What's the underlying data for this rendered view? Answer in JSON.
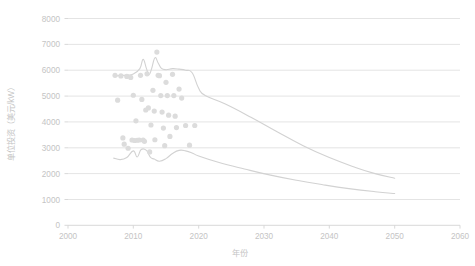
{
  "chart_data": {
    "type": "scatter",
    "title": "",
    "xlabel": "年份",
    "ylabel": "单位投资（美元/kW）",
    "xlim": [
      2000,
      2060
    ],
    "ylim": [
      0,
      8000
    ],
    "xticks": [
      "2000",
      "2010",
      "2020",
      "2030",
      "2040",
      "2050",
      "2060"
    ],
    "yticks": [
      "0",
      "1000",
      "2000",
      "3000",
      "4000",
      "5000",
      "6000",
      "7000",
      "8000"
    ],
    "grid": "horizontal",
    "legend": "none",
    "series": [
      {
        "name": "upper-trend-line",
        "type": "line",
        "color": "#d2d2d2",
        "points": [
          [
            2007,
            5780
          ],
          [
            2008,
            5790
          ],
          [
            2009,
            5810
          ],
          [
            2010,
            5850
          ],
          [
            2011,
            6060
          ],
          [
            2011.5,
            6420
          ],
          [
            2012,
            6070
          ],
          [
            2012.4,
            5830
          ],
          [
            2012.8,
            6060
          ],
          [
            2013.3,
            6480
          ],
          [
            2013.8,
            6280
          ],
          [
            2014.3,
            6070
          ],
          [
            2015,
            6020
          ],
          [
            2016,
            6060
          ],
          [
            2017,
            6040
          ],
          [
            2018,
            6000
          ],
          [
            2019,
            5900
          ],
          [
            2020,
            5300
          ],
          [
            2021,
            5020
          ],
          [
            2024,
            4700
          ],
          [
            2028,
            4180
          ],
          [
            2032,
            3620
          ],
          [
            2036,
            3080
          ],
          [
            2040,
            2620
          ],
          [
            2044,
            2240
          ],
          [
            2047,
            2000
          ],
          [
            2050,
            1820
          ]
        ]
      },
      {
        "name": "lower-trend-line",
        "type": "line",
        "color": "#d2d2d2",
        "points": [
          [
            2007,
            2600
          ],
          [
            2008,
            2540
          ],
          [
            2009,
            2620
          ],
          [
            2010,
            2880
          ],
          [
            2010.6,
            2640
          ],
          [
            2011.2,
            2930
          ],
          [
            2012,
            2900
          ],
          [
            2012.6,
            2640
          ],
          [
            2013.2,
            2560
          ],
          [
            2014,
            2480
          ],
          [
            2015,
            2580
          ],
          [
            2016,
            2780
          ],
          [
            2017,
            2900
          ],
          [
            2018,
            2880
          ],
          [
            2019,
            2800
          ],
          [
            2020,
            2680
          ],
          [
            2023,
            2440
          ],
          [
            2027,
            2180
          ],
          [
            2031,
            1940
          ],
          [
            2035,
            1740
          ],
          [
            2039,
            1570
          ],
          [
            2043,
            1420
          ],
          [
            2047,
            1300
          ],
          [
            2050,
            1230
          ]
        ]
      },
      {
        "name": "scatter-points",
        "type": "scatter",
        "color": "#dcdcdc",
        "points": [
          [
            2007.2,
            5800
          ],
          [
            2007.6,
            4840
          ],
          [
            2008.1,
            5780
          ],
          [
            2008.4,
            3380
          ],
          [
            2008.6,
            3140
          ],
          [
            2009.0,
            5760
          ],
          [
            2009.2,
            2980
          ],
          [
            2009.6,
            5720
          ],
          [
            2009.8,
            3300
          ],
          [
            2010.0,
            5030
          ],
          [
            2010.2,
            3280
          ],
          [
            2010.4,
            4040
          ],
          [
            2010.6,
            3290
          ],
          [
            2010.9,
            3300
          ],
          [
            2011.1,
            5800
          ],
          [
            2011.3,
            4870
          ],
          [
            2011.5,
            3300
          ],
          [
            2011.7,
            3250
          ],
          [
            2011.9,
            4460
          ],
          [
            2012.1,
            5860
          ],
          [
            2012.3,
            4540
          ],
          [
            2012.5,
            2840
          ],
          [
            2012.7,
            3880
          ],
          [
            2013.0,
            5220
          ],
          [
            2013.2,
            4420
          ],
          [
            2013.3,
            3310
          ],
          [
            2013.6,
            6700
          ],
          [
            2013.8,
            5800
          ],
          [
            2014.0,
            5790
          ],
          [
            2014.2,
            5020
          ],
          [
            2014.4,
            4380
          ],
          [
            2014.6,
            3760
          ],
          [
            2014.8,
            3080
          ],
          [
            2015.0,
            5530
          ],
          [
            2015.2,
            5020
          ],
          [
            2015.4,
            4260
          ],
          [
            2015.6,
            3440
          ],
          [
            2016.0,
            5840
          ],
          [
            2016.2,
            5020
          ],
          [
            2016.4,
            4220
          ],
          [
            2016.6,
            3780
          ],
          [
            2017.0,
            5270
          ],
          [
            2017.4,
            4920
          ],
          [
            2018.0,
            3860
          ],
          [
            2018.6,
            3100
          ],
          [
            2019.4,
            3860
          ]
        ]
      }
    ]
  },
  "axes": {
    "x_title": "年份",
    "y_title": "单位投资（美元/kW）"
  },
  "x_tick_labels": [
    "2000",
    "2010",
    "2020",
    "2030",
    "2040",
    "2050",
    "2060"
  ],
  "y_tick_labels": [
    "8000",
    "7000",
    "6000",
    "5000",
    "4000",
    "3000",
    "2000",
    "1000",
    "0"
  ]
}
